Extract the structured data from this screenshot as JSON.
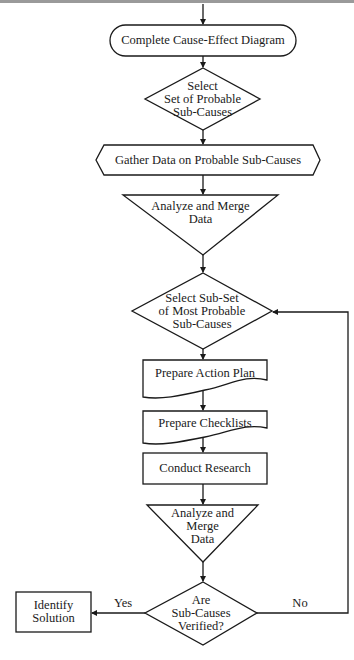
{
  "diagram": {
    "type": "flowchart",
    "nodes": [
      {
        "id": "n1",
        "shape": "terminal",
        "label": "Complete Cause-Effect Diagram"
      },
      {
        "id": "n2",
        "shape": "decision",
        "label": "Select\nSet of Probable\nSub-Causes"
      },
      {
        "id": "n3",
        "shape": "preparation",
        "label": "Gather Data on Probable Sub-Causes"
      },
      {
        "id": "n4",
        "shape": "merge",
        "label": "Analyze and Merge\nData"
      },
      {
        "id": "n5",
        "shape": "decision",
        "label": "Select Sub-Set\nof Most Probable\nSub-Causes"
      },
      {
        "id": "n6",
        "shape": "document",
        "label": "Prepare Action Plan"
      },
      {
        "id": "n7",
        "shape": "document",
        "label": "Prepare Checklists"
      },
      {
        "id": "n8",
        "shape": "process",
        "label": "Conduct Research"
      },
      {
        "id": "n9",
        "shape": "merge",
        "label": "Analyze and\nMerge\nData"
      },
      {
        "id": "n10",
        "shape": "decision",
        "label": "Are\nSub-Causes\nVerified?"
      },
      {
        "id": "n11",
        "shape": "process",
        "label": "Identify\nSolution"
      }
    ],
    "edges": [
      {
        "from": "start",
        "to": "n1",
        "label": ""
      },
      {
        "from": "n1",
        "to": "n2",
        "label": ""
      },
      {
        "from": "n2",
        "to": "n3",
        "label": ""
      },
      {
        "from": "n3",
        "to": "n4",
        "label": ""
      },
      {
        "from": "n4",
        "to": "n5",
        "label": ""
      },
      {
        "from": "n5",
        "to": "n6",
        "label": ""
      },
      {
        "from": "n6",
        "to": "n7",
        "label": ""
      },
      {
        "from": "n7",
        "to": "n8",
        "label": ""
      },
      {
        "from": "n8",
        "to": "n9",
        "label": ""
      },
      {
        "from": "n9",
        "to": "n10",
        "label": ""
      },
      {
        "from": "n10",
        "to": "n11",
        "label": "Yes"
      },
      {
        "from": "n10",
        "to": "n5",
        "label": "No"
      }
    ],
    "edge_labels": {
      "yes": "Yes",
      "no": "No"
    },
    "colors": {
      "stroke": "#1a1a1a",
      "background": "#ffffff",
      "top_rule": "#9a9a9a"
    }
  }
}
